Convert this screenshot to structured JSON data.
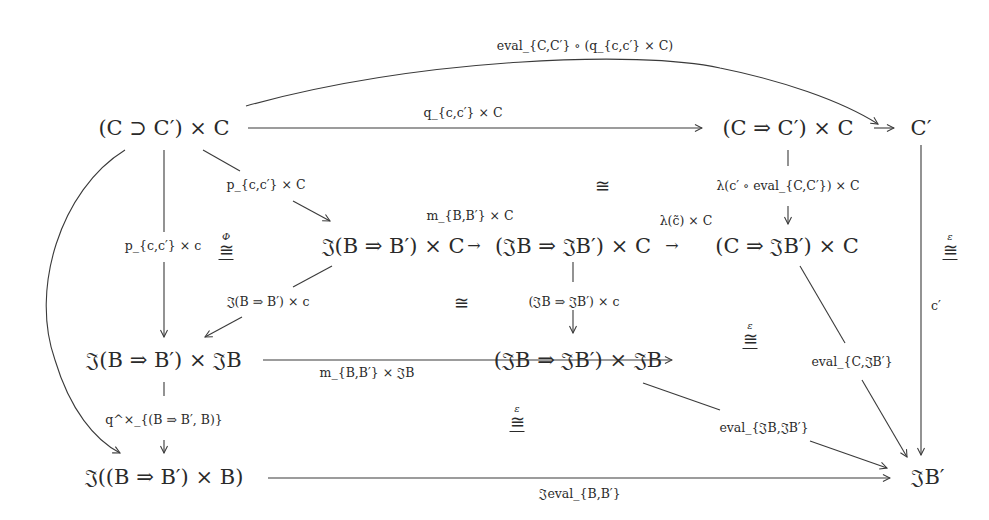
{
  "diagram": {
    "type": "commutative-diagram",
    "nodes": {
      "n11": "(C ⊃ C′) × C",
      "n13": "(C ⇒ C′) × C",
      "n14": "C′",
      "n22": "𝔍(B ⇒ B′) × C",
      "n23": "(𝔍B ⇒ 𝔍B′) × C",
      "n24": "(C ⇒ 𝔍B′) × C",
      "n31": "𝔍(B ⇒ B′) × 𝔍B",
      "n33": "(𝔍B ⇒ 𝔍B′) × 𝔍B",
      "n41": "𝔍((B ⇒ B′) × B)",
      "n44": "𝔍B′"
    },
    "edge_labels": {
      "top_curve": "eval_{C,C′} ∘ (q_{c,c′} × C)",
      "top_straight": "q_{c,c′} × C",
      "diag_p": "p_{c,c′} × C",
      "left_vertical": "p_{c,c′} × c",
      "m_C": "m_{B,B′} × C",
      "lambda_c_tilde": "λ(c̃) × C",
      "lambda_eval": "λ(c′ ∘ eval_{C,C′}) × C",
      "J_times_c": "𝔍(B ⇒ B′) × c",
      "JB_times_c": "(𝔍B ⇒ 𝔍B′) × c",
      "m_JB": "m_{B,B′} × 𝔍B",
      "q_times": "q^×_{(B ⇒ B′, B)}",
      "c_prime": "c′",
      "eval_C_JB": "eval_{C,𝔍B′}",
      "eval_JB_JB": "eval_{𝔍B,𝔍B′}",
      "J_eval": "𝔍eval_{B,B′}"
    },
    "cells": {
      "iso_phi": {
        "symbol": "≅",
        "sup": "Φ"
      },
      "iso_mid_top": {
        "symbol": "≅",
        "sup": ""
      },
      "iso_mid": {
        "symbol": "≅",
        "sup": ""
      },
      "iso_eps_right": {
        "symbol": "≅",
        "sup": "ε"
      },
      "iso_eps_mid": {
        "symbol": "≅",
        "sup": "ε"
      },
      "iso_eps_bottom": {
        "symbol": "≅",
        "sup": "ε"
      }
    },
    "arrow_glyphs": {
      "down": "↓",
      "right": "→",
      "down_right": "↘",
      "down_left": "↙"
    }
  }
}
